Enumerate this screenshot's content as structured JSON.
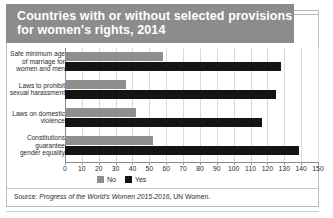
{
  "title": {
    "line1": "Countries with or without selected provisions",
    "line2": "for women's rights, 2014"
  },
  "source": {
    "prefix": "Source: ",
    "italic": "Progress of the World's Women 2015-2016",
    "suffix": ", UN Women."
  },
  "colors": {
    "title_band": "#8c8c8c",
    "no": "#8e8e8e",
    "yes": "#141414",
    "grid": "#dadada",
    "axis": "#8a8a8a"
  },
  "chart_data": {
    "type": "bar",
    "orientation": "horizontal",
    "title": "Countries with or without selected provisions for women's rights, 2014",
    "xlabel": "",
    "ylabel": "",
    "xlim": [
      0,
      150
    ],
    "xticks": [
      0,
      10,
      20,
      30,
      40,
      50,
      60,
      70,
      80,
      90,
      100,
      110,
      120,
      130,
      140,
      150
    ],
    "xtick_labels": [
      "0",
      "10",
      "20",
      "30",
      "40",
      "50",
      "60",
      "70",
      "80",
      "90",
      "100",
      "110",
      "120",
      "130",
      "140",
      "150"
    ],
    "grid": true,
    "legend_position": "bottom",
    "categories": [
      "Safe minimum age of marriage for women and men",
      "Laws to prohibit sexual harassment",
      "Laws on domestic violence",
      "Constitutions guarantee gender equality"
    ],
    "category_lines": [
      [
        "Safe minimum age",
        "of marriage for",
        "women and men"
      ],
      [
        "Laws to prohibit",
        "sexual harassment"
      ],
      [
        "Laws on domestic",
        "violence"
      ],
      [
        "Constitutions",
        "guarantee",
        "gender equality"
      ]
    ],
    "series": [
      {
        "name": "No",
        "color": "#8e8e8e",
        "values": [
          58,
          36,
          42,
          52
        ]
      },
      {
        "name": "Yes",
        "color": "#141414",
        "values": [
          128,
          125,
          117,
          139
        ]
      }
    ]
  }
}
